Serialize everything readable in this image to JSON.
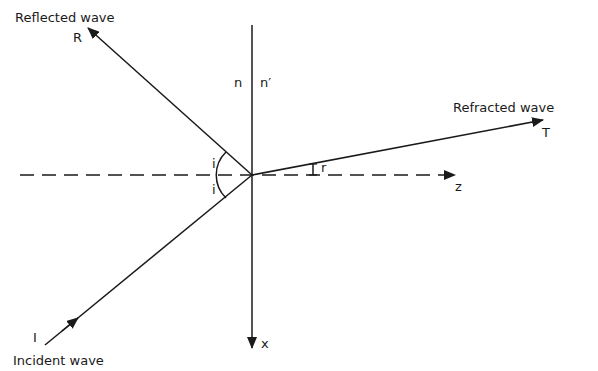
{
  "diagram": {
    "type": "reflection-refraction-ray-diagram",
    "colors": {
      "line": "#1a1a1a",
      "background": "#ffffff"
    },
    "labels": {
      "reflected_wave": "Reflected wave",
      "reflected_symbol": "R",
      "refracted_wave": "Refracted wave",
      "refracted_symbol": "T",
      "incident_wave": "Incident wave",
      "incident_symbol": "I",
      "medium_1": "n",
      "medium_2": "n′",
      "angle_incidence_upper": "i",
      "angle_incidence_lower": "i",
      "angle_refraction": "r",
      "axis_z": "z",
      "axis_x": "x"
    },
    "geometry": {
      "origin": [
        252,
        175
      ],
      "normal_axis": {
        "from": [
          252,
          25
        ],
        "to": [
          252,
          348
        ],
        "label": "x"
      },
      "interface_axis": {
        "from": [
          20,
          175
        ],
        "to": [
          455,
          175
        ],
        "dashed": true,
        "label": "z"
      },
      "incident_ray": {
        "from": [
          45,
          345
        ],
        "to": [
          252,
          175
        ]
      },
      "reflected_ray": {
        "from": [
          252,
          175
        ],
        "to": [
          88,
          28
        ]
      },
      "refracted_ray": {
        "from": [
          252,
          175
        ],
        "to": [
          543,
          120
        ]
      }
    }
  }
}
